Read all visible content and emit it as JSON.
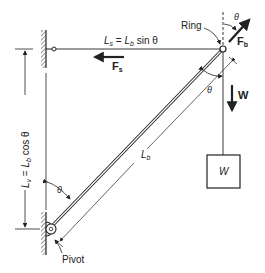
{
  "diagram": {
    "labels": {
      "ring": "Ring",
      "pivot": "Pivot",
      "theta_top": "θ",
      "theta_ring": "θ",
      "theta_pivot": "θ",
      "fb_main": "F",
      "fb_sub": "b",
      "fs_main": "F",
      "fs_sub": "s",
      "w_force": "W",
      "w_box": "W",
      "ls_eq_lhs_main": "L",
      "ls_eq_lhs_sub": "s",
      "ls_eq_mid": " = ",
      "ls_eq_rhs_main": "L",
      "ls_eq_rhs_sub": "b",
      "ls_eq_tail": " sin θ",
      "lv_eq_lhs_main": "L",
      "lv_eq_lhs_sub": "v",
      "lv_eq_mid": " = ",
      "lv_eq_rhs_main": "L",
      "lv_eq_rhs_sub": "b",
      "lv_eq_tail": " cos θ",
      "lb_main": "L",
      "lb_sub": "b"
    },
    "colors": {
      "ink": "#222222",
      "background": "#ffffff"
    }
  }
}
